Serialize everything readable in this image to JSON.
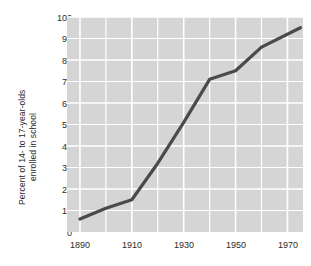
{
  "chart_data": {
    "type": "line",
    "title": "",
    "xlabel": "",
    "ylabel": "Percent of 14- to 17-year-olds enrolled in school",
    "ylabel_lines": [
      "Percent of 14- to 17-year-olds",
      "enrolled in school"
    ],
    "xlim": [
      1885,
      1976
    ],
    "ylim": [
      0,
      100
    ],
    "grid": true,
    "legend": "none",
    "x_tick_labels": [
      "1890",
      "1910",
      "1930",
      "1950",
      "1970"
    ],
    "x_ticks": [
      1890,
      1910,
      1930,
      1950,
      1970
    ],
    "y_tick_labels": [
      "0",
      "10",
      "20",
      "30",
      "40",
      "50",
      "60",
      "70",
      "80",
      "90",
      "100"
    ],
    "y_ticks": [
      0,
      10,
      20,
      30,
      40,
      50,
      60,
      70,
      80,
      90,
      100
    ],
    "x": [
      1890,
      1900,
      1910,
      1920,
      1930,
      1940,
      1950,
      1960,
      1975
    ],
    "values": [
      6,
      11,
      15,
      32,
      51,
      71,
      75,
      86,
      95
    ],
    "series": [
      {
        "name": "Percent of 14- to 17-year-olds enrolled in school",
        "x": [
          1890,
          1900,
          1910,
          1920,
          1930,
          1940,
          1950,
          1960,
          1975
        ],
        "values": [
          6,
          11,
          15,
          32,
          51,
          71,
          75,
          86,
          95
        ]
      }
    ]
  },
  "colors": {
    "line": "#4a4a4a",
    "plot_background": "#d5d5d5",
    "gridline": "#ffffff",
    "text": "#2b2b2b",
    "page_background": "#ffffff"
  }
}
